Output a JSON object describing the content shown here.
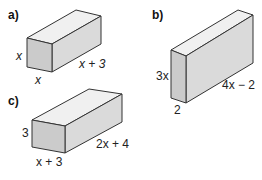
{
  "parts": [
    {
      "id": "a",
      "label": "a)",
      "height_label": "x",
      "width_label": "x",
      "length_label": "x + 3"
    },
    {
      "id": "b",
      "label": "b)",
      "height_label": "3x",
      "width_label": "2",
      "length_label": "4x − 2"
    },
    {
      "id": "c",
      "label": "c)",
      "height_label": "3",
      "width_label": "x + 3",
      "length_label": "2x + 4"
    }
  ],
  "colors": {
    "front_face": "#cfcfcf",
    "side_face": "#dcdcdc",
    "top_face": "#f0f0f0",
    "edge": "#333333"
  }
}
